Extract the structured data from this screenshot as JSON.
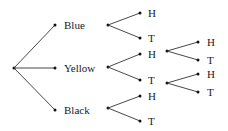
{
  "diagram": {
    "type": "tree",
    "root": {
      "x": 14,
      "y": 68
    },
    "level1": [
      {
        "label": "Blue",
        "x": 55,
        "y": 25,
        "origin": {
          "x": 108,
          "y": 25
        }
      },
      {
        "label": "Yellow",
        "x": 55,
        "y": 68,
        "origin": {
          "x": 108,
          "y": 67
        }
      },
      {
        "label": "Black",
        "x": 55,
        "y": 110,
        "origin": {
          "x": 108,
          "y": 108
        }
      }
    ],
    "level2": [
      {
        "label": "H",
        "parent": 0,
        "x": 140,
        "y": 13
      },
      {
        "label": "T",
        "parent": 0,
        "x": 140,
        "y": 38
      },
      {
        "label": "H",
        "parent": 1,
        "x": 140,
        "y": 54
      },
      {
        "label": "T",
        "parent": 1,
        "x": 140,
        "y": 80
      },
      {
        "label": "H",
        "parent": 2,
        "x": 140,
        "y": 96
      },
      {
        "label": "T",
        "parent": 2,
        "x": 140,
        "y": 121
      }
    ],
    "level3": [
      {
        "label": "H",
        "from": 2,
        "origin": {
          "x": 167,
          "y": 51
        },
        "x": 198,
        "y": 42
      },
      {
        "label": "T",
        "from": 2,
        "origin": {
          "x": 167,
          "y": 51
        },
        "x": 198,
        "y": 60
      },
      {
        "label": "H",
        "from": 3,
        "origin": {
          "x": 167,
          "y": 83
        },
        "x": 198,
        "y": 74
      },
      {
        "label": "T",
        "from": 3,
        "origin": {
          "x": 167,
          "y": 83
        },
        "x": 198,
        "y": 92
      }
    ]
  }
}
